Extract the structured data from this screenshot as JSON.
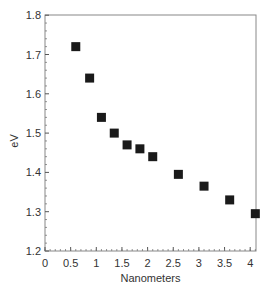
{
  "chart_data": {
    "type": "scatter",
    "title": "",
    "xlabel": "Nanometers",
    "ylabel": "eV",
    "xlim": [
      0,
      4.2
    ],
    "ylim": [
      1.2,
      1.8
    ],
    "xticks": [
      "0",
      "0.5",
      "1",
      "1.5",
      "2",
      "2.5",
      "3",
      "3.5",
      "4"
    ],
    "yticks": [
      "1.2",
      "1.3",
      "1.4",
      "1.5",
      "1.6",
      "1.7",
      "1.8"
    ],
    "grid": false,
    "legend": null,
    "marker": "square",
    "marker_color": "#1a1a1a",
    "series": [
      {
        "name": "data",
        "x": [
          0.6,
          0.87,
          1.1,
          1.35,
          1.6,
          1.85,
          2.1,
          2.6,
          3.1,
          3.6,
          4.1
        ],
        "y": [
          1.72,
          1.64,
          1.54,
          1.5,
          1.47,
          1.46,
          1.44,
          1.395,
          1.365,
          1.33,
          1.295
        ]
      }
    ]
  }
}
